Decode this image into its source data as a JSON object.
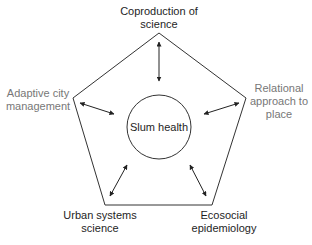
{
  "diagram": {
    "center": {
      "label": "Slum health"
    },
    "nodes": [
      {
        "id": "top",
        "line1": "Coproduction of",
        "line2": "science",
        "color": "#1e1e1e"
      },
      {
        "id": "left",
        "line1": "Adaptive city",
        "line2": "management",
        "color": "#777777"
      },
      {
        "id": "right",
        "line1": "Relational",
        "line2": "approach to",
        "line3": "place",
        "color": "#777777"
      },
      {
        "id": "bottom-left",
        "line1": "Urban systems",
        "line2": "science",
        "color": "#1e1e1e"
      },
      {
        "id": "bottom-right",
        "line1": "Ecosocial",
        "line2": "epidemiology",
        "color": "#1e1e1e"
      }
    ],
    "edges": [
      {
        "from": "top",
        "to": "center",
        "type": "bidirectional"
      },
      {
        "from": "left",
        "to": "center",
        "type": "bidirectional"
      },
      {
        "from": "right",
        "to": "center",
        "type": "bidirectional"
      },
      {
        "from": "bottom-left",
        "to": "center",
        "type": "bidirectional"
      },
      {
        "from": "bottom-right",
        "to": "center",
        "type": "bidirectional"
      }
    ],
    "shape": "pentagon"
  }
}
